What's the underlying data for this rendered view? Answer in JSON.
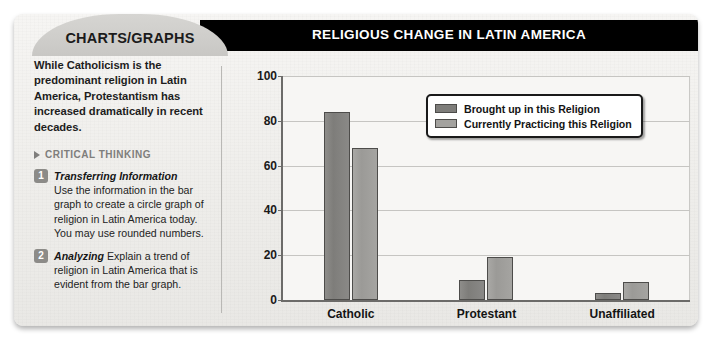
{
  "tab": {
    "label": "CHARTS/GRAPHS"
  },
  "title": {
    "text": "RELIGIOUS CHANGE IN LATIN AMERICA"
  },
  "left_panel": {
    "intro": "While Catholicism is the predominant religion in Latin America, Protestantism has increased dramatically in recent decades.",
    "critical_thinking_heading": "CRITICAL THINKING",
    "questions": [
      {
        "number": "1",
        "title": "Transferring Information",
        "text": "Use the information in the bar graph to create a circle graph of religion in Latin America today. You may use rounded numbers."
      },
      {
        "number": "2",
        "title": "Analyzing",
        "text": "Explain a trend of religion in Latin America that is evident from the bar graph."
      }
    ]
  },
  "chart_data": {
    "type": "bar",
    "title": "RELIGIOUS CHANGE IN LATIN AMERICA",
    "xlabel": "",
    "ylabel": "",
    "categories": [
      "Catholic",
      "Protestant",
      "Unaffiliated"
    ],
    "series": [
      {
        "name": "Brought up in this Religion",
        "values": [
          84,
          9,
          3
        ],
        "color": "#7e7d7a"
      },
      {
        "name": "Currently Practicing this Religion",
        "values": [
          68,
          19,
          8
        ],
        "color": "#a3a29f"
      }
    ],
    "ylim": [
      0,
      100
    ],
    "yticks": [
      "0",
      "20",
      "40",
      "60",
      "80",
      "100"
    ],
    "grid": true,
    "legend_position": "top-right"
  },
  "colors": {
    "title_bar": "#000000",
    "tab": "#cfcecb",
    "card": "#f2f1ef",
    "series_0": "#7e7d7a",
    "series_1": "#a3a29f"
  }
}
